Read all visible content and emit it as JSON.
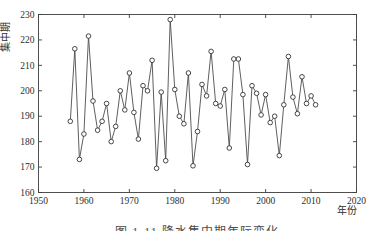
{
  "figure": {
    "caption": "图 1-11  降水集中期年际变化",
    "bg_color": "#ffffff",
    "axis_color": "#3d3d3d",
    "line_color": "#4d4d4d",
    "marker_style": "open-circle",
    "marker_fill": "#ffffff",
    "marker_stroke": "#333333"
  },
  "chart_data": {
    "type": "line",
    "title": "图 1-11  降水集中期年际变化",
    "xlabel": "年份",
    "ylabel": "集中期",
    "xlim": [
      1950,
      2020
    ],
    "ylim": [
      160,
      230
    ],
    "xticks": [
      1950,
      1960,
      1970,
      1980,
      1990,
      2000,
      2010,
      2020
    ],
    "yticks": [
      160,
      170,
      180,
      190,
      200,
      210,
      220,
      230
    ],
    "grid": false,
    "legend_position": "none",
    "x": [
      1957,
      1958,
      1959,
      1960,
      1961,
      1962,
      1963,
      1964,
      1965,
      1966,
      1967,
      1968,
      1969,
      1970,
      1971,
      1972,
      1973,
      1974,
      1975,
      1976,
      1977,
      1978,
      1979,
      1980,
      1981,
      1982,
      1983,
      1984,
      1985,
      1986,
      1987,
      1988,
      1989,
      1990,
      1991,
      1992,
      1993,
      1994,
      1995,
      1996,
      1997,
      1998,
      1999,
      2000,
      2001,
      2002,
      2003,
      2004,
      2005,
      2006,
      2007,
      2008,
      2009,
      2010,
      2011
    ],
    "series": [
      {
        "name": "集中期",
        "values": [
          188,
          216.5,
          173,
          183,
          221.5,
          196,
          184.5,
          188,
          195,
          180,
          186,
          200,
          192.5,
          207,
          191.5,
          181,
          202,
          200,
          212,
          169.5,
          199.5,
          172.5,
          228,
          200.5,
          190,
          187,
          207,
          170.5,
          184,
          202.5,
          198,
          215.5,
          195,
          194,
          200.5,
          177.5,
          212.5,
          212.5,
          198.5,
          171,
          202,
          199,
          190.5,
          198.5,
          187.5,
          190,
          174.5,
          194.5,
          213.5,
          197.5,
          191,
          205.5,
          195,
          198,
          194.5
        ]
      }
    ]
  }
}
